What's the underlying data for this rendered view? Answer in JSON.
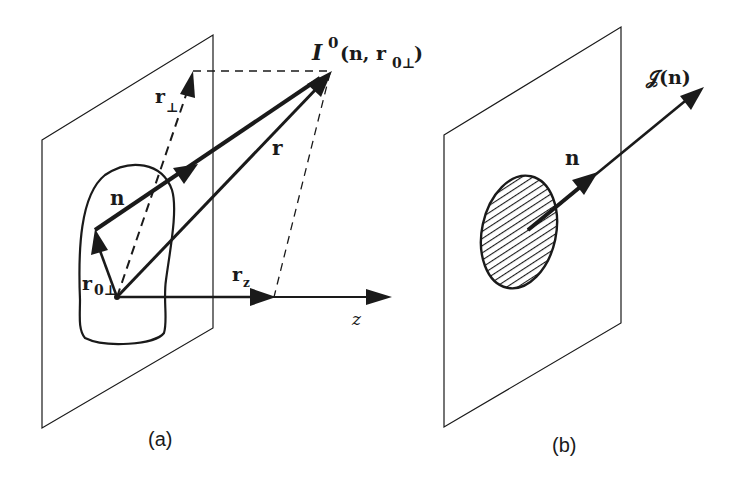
{
  "figure": {
    "panels": [
      {
        "id": "a",
        "caption": "(a)",
        "labels": {
          "intensity_main": "I",
          "intensity_sup": "0",
          "intensity_args": "(n, r",
          "intensity_sub": "0⊥",
          "intensity_close": ")",
          "r_perp_base": "r",
          "r_perp_sub": "⊥",
          "n": "n",
          "r": "r",
          "r0perp_base": "r",
          "r0perp_sub": "0⊥",
          "rz_base": "r",
          "rz_sub": "z",
          "z_axis": "z"
        }
      },
      {
        "id": "b",
        "caption": "(b)",
        "labels": {
          "n": "n",
          "radiance_func": "𝒥(n)"
        }
      }
    ],
    "colors": {
      "ink": "#1a1a1a",
      "background": "#ffffff"
    }
  }
}
